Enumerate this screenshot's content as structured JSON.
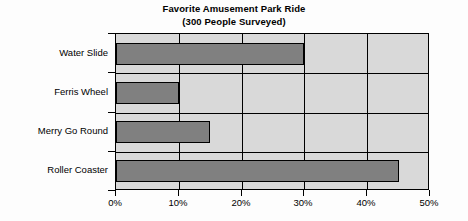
{
  "chart_data": {
    "type": "bar",
    "orientation": "horizontal",
    "title": "Favorite Amusement Park Ride",
    "subtitle": "(300 People Surveyed)",
    "categories": [
      "Water Slide",
      "Ferris Wheel",
      "Merry Go Round",
      "Roller Coaster"
    ],
    "values": [
      30,
      10,
      15,
      45
    ],
    "value_unit": "%",
    "xlabel": "",
    "ylabel": "",
    "xlim": [
      0,
      50
    ],
    "xticks": [
      0,
      10,
      20,
      30,
      40,
      50
    ],
    "xtick_labels": [
      "0%",
      "10%",
      "20%",
      "30%",
      "40%",
      "50%"
    ],
    "grid": true,
    "grid_axis": "x",
    "legend": false,
    "colors": {
      "bar_fill": "#808080",
      "bar_border": "#000000",
      "plot_background": "#d9d9d9",
      "page_background": "#fdfdfd",
      "text": "#000000",
      "gridline": "#000000"
    }
  }
}
